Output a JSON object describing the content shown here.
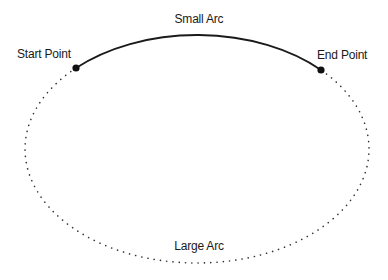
{
  "diagram": {
    "labels": {
      "small_arc": "Small Arc",
      "large_arc": "Large Arc",
      "start_point": "Start Point",
      "end_point": "End Point"
    },
    "arcs": [
      {
        "name": "small-arc",
        "style": "solid",
        "color": "#1a1a1a"
      },
      {
        "name": "large-arc",
        "style": "dotted",
        "color": "#333333"
      }
    ],
    "points": [
      {
        "name": "start-point",
        "color": "#111111"
      },
      {
        "name": "end-point",
        "color": "#111111"
      }
    ]
  }
}
